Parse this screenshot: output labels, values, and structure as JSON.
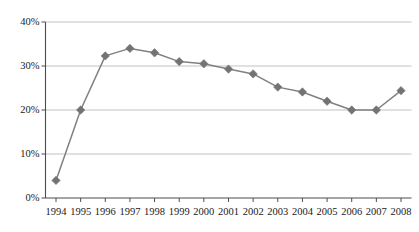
{
  "chart_data": {
    "type": "line",
    "title": "",
    "subtitle": "",
    "xlabel": "",
    "ylabel": "",
    "categories": [
      "1994",
      "1995",
      "1996",
      "1997",
      "1998",
      "1999",
      "2000",
      "2001",
      "2002",
      "2003",
      "2004",
      "2005",
      "2006",
      "2007",
      "2008"
    ],
    "values": [
      4.0,
      20.0,
      32.3,
      34.0,
      33.0,
      31.0,
      30.5,
      29.3,
      28.2,
      25.2,
      24.1,
      22.0,
      20.0,
      20.0,
      24.4
    ],
    "series": [
      {
        "name": "",
        "values": [
          4.0,
          20.0,
          32.3,
          34.0,
          33.0,
          31.0,
          30.5,
          29.3,
          28.2,
          25.2,
          24.1,
          22.0,
          20.0,
          20.0,
          24.4
        ]
      }
    ],
    "ylim": [
      0,
      40
    ],
    "yticks": [
      0,
      10,
      20,
      30,
      40
    ],
    "ytick_labels": [
      "0%",
      "10%",
      "20%",
      "30%",
      "40%"
    ],
    "xtick_labels": [
      "1994",
      "1995",
      "1996",
      "1997",
      "1998",
      "1999",
      "2000",
      "2001",
      "2002",
      "2003",
      "2004",
      "2005",
      "2006",
      "2007",
      "2008"
    ],
    "grid": "horizontal",
    "legend": "none",
    "marker": "diamond",
    "line_color": "#808080",
    "marker_color": "#737373",
    "grid_color": "#b3b3b3",
    "axis_color": "#4d4d4d",
    "text_color": "#1a1a1a",
    "plot_background": "#ffffff"
  }
}
